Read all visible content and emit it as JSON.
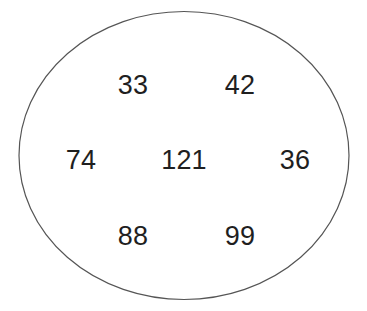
{
  "diagram": {
    "type": "set-diagram",
    "shape": "ellipse",
    "stroke_color": "#555555",
    "fill_color": "#ffffff",
    "background_color": "#ffffff",
    "text_color": "#1f1f1f",
    "rows": [
      {
        "name": "top-row",
        "items": [
          {
            "value": "33",
            "column": "left"
          },
          {
            "value": "42",
            "column": "right"
          }
        ]
      },
      {
        "name": "middle-row",
        "items": [
          {
            "value": "74",
            "column": "far-left"
          },
          {
            "value": "121",
            "column": "center"
          },
          {
            "value": "36",
            "column": "far-right"
          }
        ]
      },
      {
        "name": "bottom-row",
        "items": [
          {
            "value": "88",
            "column": "left"
          },
          {
            "value": "99",
            "column": "right"
          }
        ]
      }
    ],
    "members": [
      "33",
      "42",
      "74",
      "121",
      "36",
      "88",
      "99"
    ]
  }
}
